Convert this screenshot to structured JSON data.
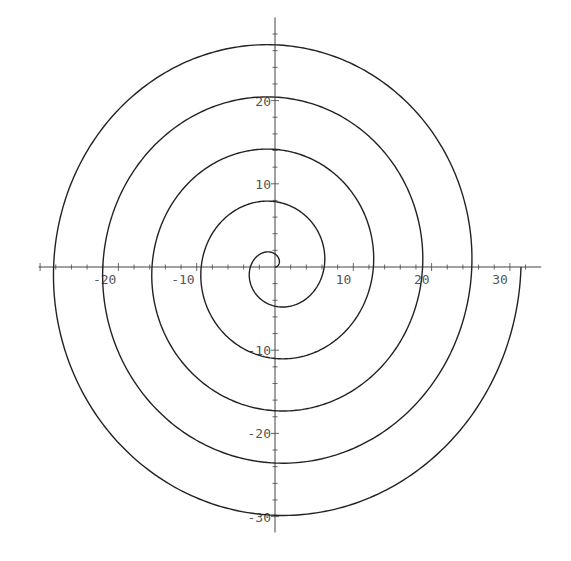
{
  "chart_data": {
    "type": "line",
    "title": "",
    "xlabel": "",
    "ylabel": "",
    "xlim": [
      -32,
      33
    ],
    "ylim": [
      -31.5,
      31.5
    ],
    "grid": false,
    "legend": null,
    "x_ticks": [
      -20,
      -10,
      10,
      20,
      30
    ],
    "y_ticks": [
      20,
      10,
      -10,
      -20,
      -30
    ],
    "x_tick_labels": [
      "-20",
      "-10",
      "10",
      "20",
      "30"
    ],
    "y_tick_labels": [
      "20",
      "10",
      "-10",
      "-20",
      "-30"
    ],
    "series": [
      {
        "name": "spiral",
        "equation": "r = theta",
        "theta_range": [
          0,
          31.416
        ],
        "color": "#222222",
        "axis_crossings": {
          "positive_x": [
            6.28,
            12.57,
            18.85,
            25.13,
            31.42
          ],
          "positive_y": [
            1.57,
            7.85,
            14.14,
            20.42,
            26.7
          ],
          "negative_x": [
            -3.14,
            -9.42,
            -15.71,
            -21.99,
            -28.27
          ],
          "negative_y": [
            -4.71,
            -10.99,
            -17.28,
            -23.56,
            -29.85
          ]
        }
      }
    ]
  },
  "style": {
    "axis_color": "#444444",
    "curve_color": "#222222",
    "label_color": "#555555",
    "background": "#ffffff"
  },
  "layout": {
    "origin_x": 275,
    "origin_y": 267,
    "scale_x": 7.83,
    "scale_y": 8.32,
    "x_axis_from": -30.2,
    "x_axis_to": 34.0,
    "y_axis_from": -31.9,
    "y_axis_to": 30.0,
    "minor_tick_step": 2
  }
}
